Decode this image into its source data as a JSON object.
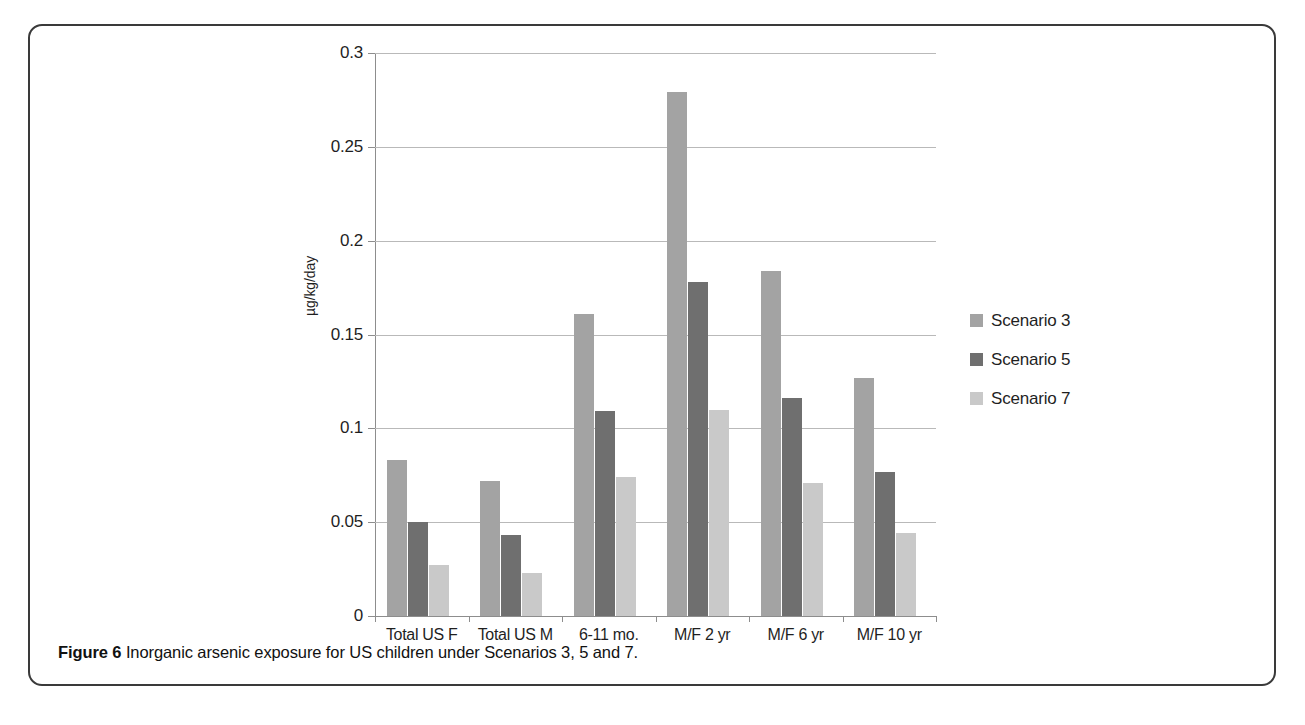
{
  "figure": {
    "caption_label": "Figure 6",
    "caption_text": "Inorganic arsenic exposure for US children under Scenarios 3, 5 and 7."
  },
  "chart_data": {
    "type": "bar",
    "title": "",
    "xlabel": "",
    "ylabel": "µg/kg/day",
    "ylim": [
      0,
      0.3
    ],
    "yticks": [
      "0",
      "0.05",
      "0.1",
      "0.15",
      "0.2",
      "0.25",
      "0.3"
    ],
    "ytick_values": [
      0,
      0.05,
      0.1,
      0.15,
      0.2,
      0.25,
      0.3
    ],
    "grid": true,
    "legend_position": "right",
    "categories": [
      "Total US F",
      "Total US M",
      "6-11 mo.",
      "M/F 2 yr",
      "M/F 6 yr",
      "M/F 10 yr"
    ],
    "series": [
      {
        "name": "Scenario 3",
        "color": "#a3a3a3",
        "values": [
          0.083,
          0.072,
          0.161,
          0.279,
          0.184,
          0.127
        ]
      },
      {
        "name": "Scenario 5",
        "color": "#6f6f6f",
        "values": [
          0.05,
          0.043,
          0.109,
          0.178,
          0.116,
          0.077
        ]
      },
      {
        "name": "Scenario 7",
        "color": "#c9c9c9",
        "values": [
          0.027,
          0.023,
          0.074,
          0.11,
          0.071,
          0.044
        ]
      }
    ]
  }
}
